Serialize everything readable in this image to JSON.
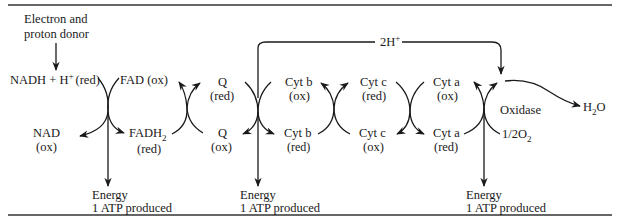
{
  "diagram": {
    "type": "electron-transport-chain",
    "donor_label_line1": "Electron and",
    "donor_label_line2": "proton donor",
    "nadh": "NADH + H",
    "nadh_sup": "+",
    "nadh_state": "(red)",
    "nad": "NAD",
    "nad_state": "(ox)",
    "fad": "FAD (ox)",
    "fadh": "FADH",
    "fadh_sub": "2",
    "fadh_state": "(red)",
    "q_top": "Q",
    "q_top_state": "(red)",
    "q_bottom": "Q",
    "q_bottom_state": "(ox)",
    "cytb_top": "Cyt b",
    "cytb_top_state": "(ox)",
    "cytb_bottom": "Cyt b",
    "cytb_bottom_state": "(red)",
    "cytc_top": "Cyt c",
    "cytc_top_state": "(red)",
    "cytc_bottom": "Cyt c",
    "cytc_bottom_state": "(ox)",
    "cyta_top": "Cyt a",
    "cyta_top_state": "(ox)",
    "cyta_bottom": "Cyt a",
    "cyta_bottom_state": "(red)",
    "oxidase": "Oxidase",
    "oxygen": "1/2O",
    "oxygen_sub": "2",
    "water": "H",
    "water_sub": "2",
    "water_end": "O",
    "protons": "2H",
    "protons_sup": "+",
    "energy": [
      {
        "line1": "Energy",
        "line2": "1 ATP produced"
      },
      {
        "line1": "Energy",
        "line2": "1 ATP produced"
      },
      {
        "line1": "Energy",
        "line2": "1 ATP produced"
      }
    ]
  }
}
